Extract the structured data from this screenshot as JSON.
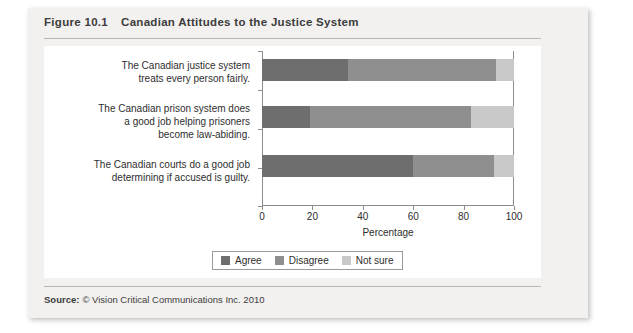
{
  "figure": {
    "number": "Figure 10.1",
    "title": "Canadian Attitudes to the Justice System"
  },
  "source": {
    "label": "Source:",
    "text": "© Vision Critical Communications Inc. 2010"
  },
  "colors": {
    "agree": "#6e6e6e",
    "disagree": "#8f8f8f",
    "not_sure": "#c9c9c9",
    "card_background": "#f2f1ef",
    "plot_background": "#ffffff",
    "axis": "#8d8d8d",
    "text": "#2e2e2e"
  },
  "chart_data": {
    "type": "bar",
    "orientation": "horizontal",
    "stacked": true,
    "stack_total": 100,
    "title": "Canadian Attitudes to the Justice System",
    "xlabel": "Percentage",
    "ylabel": "",
    "xlim": [
      0,
      100
    ],
    "xticks": [
      0,
      20,
      40,
      60,
      80,
      100
    ],
    "xtick_labels": [
      "0",
      "20",
      "40",
      "60",
      "80",
      "100"
    ],
    "grid": false,
    "legend_position": "bottom",
    "categories": [
      {
        "id": "justice-system-fair",
        "lines": [
          "The Canadian justice system",
          "treats every person fairly."
        ]
      },
      {
        "id": "prison-system-law-abiding",
        "lines": [
          "The Canadian prison system does",
          "a good job helping prisoners",
          "become law-abiding."
        ]
      },
      {
        "id": "courts-determining-guilt",
        "lines": [
          "The Canadian courts do a good job",
          "determining if accused is guilty."
        ]
      }
    ],
    "series": [
      {
        "name": "Agree",
        "color": "#6e6e6e",
        "values": [
          34,
          19,
          60
        ]
      },
      {
        "name": "Disagree",
        "color": "#8f8f8f",
        "values": [
          59,
          64,
          32
        ]
      },
      {
        "name": "Not sure",
        "color": "#c9c9c9",
        "values": [
          7,
          17,
          8
        ]
      }
    ],
    "legend": [
      {
        "label": "Agree",
        "color": "#6e6e6e"
      },
      {
        "label": "Disagree",
        "color": "#8f8f8f"
      },
      {
        "label": "Not sure",
        "color": "#c9c9c9"
      }
    ]
  }
}
